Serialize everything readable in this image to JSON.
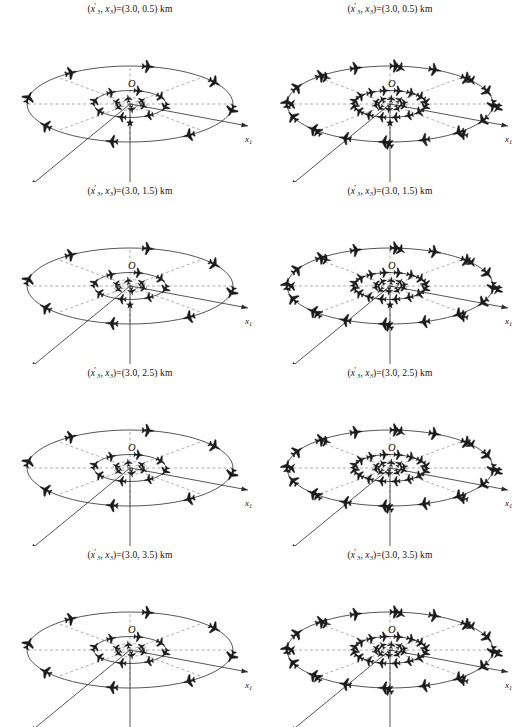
{
  "figure": {
    "type": "multi-panel-3d-geometry-diagram",
    "rows": 4,
    "columns": 2,
    "axes": {
      "x1_label": "x",
      "x1_sub": "1",
      "x2_label": "x",
      "x2_sub": "2",
      "x3_label": "x",
      "x3_sub": "3",
      "origin_label": "O"
    },
    "title_prefix": "(",
    "title_var1": "x",
    "title_var1_sub": "3",
    "title_prime": "′",
    "title_sep": ", ",
    "title_var2": "x",
    "title_var2_sub": "3",
    "title_eq": ")=(",
    "title_close": ") km",
    "colors": {
      "stroke": "#2b2b2b",
      "dashed": "#777777",
      "ink": "#111111",
      "background": "#ffffff"
    }
  },
  "panels": [
    {
      "id": "panel-r1c1",
      "row": 1,
      "column": 1,
      "density": "sparse",
      "title": {
        "x0_value": "3.0",
        "x3_value": "0.5",
        "unit": "km",
        "full_text": "(x′3, x3)=(3.0, 0.5) km"
      },
      "has_star_marker": true,
      "outer_ring_count": 8,
      "inner_ring_count": 8
    },
    {
      "id": "panel-r1c2",
      "row": 1,
      "column": 2,
      "density": "dense",
      "title": {
        "x0_value": "3.0",
        "x3_value": "0.5",
        "unit": "km",
        "full_text": "(x′3, x3)=(3.0, 0.5) km"
      },
      "has_star_marker": true,
      "outer_ring_count": 16,
      "inner_ring_count": 16
    },
    {
      "id": "panel-r2c1",
      "row": 2,
      "column": 1,
      "density": "sparse",
      "title": {
        "x0_value": "3.0",
        "x3_value": "1.5",
        "unit": "km",
        "full_text": "(x′3, x3)=(3.0, 1.5) km"
      },
      "has_star_marker": true,
      "outer_ring_count": 8,
      "inner_ring_count": 8
    },
    {
      "id": "panel-r2c2",
      "row": 2,
      "column": 2,
      "density": "dense",
      "title": {
        "x0_value": "3.0",
        "x3_value": "1.5",
        "unit": "km",
        "full_text": "(x′3, x3)=(3.0, 1.5) km"
      },
      "has_star_marker": true,
      "outer_ring_count": 16,
      "inner_ring_count": 16
    },
    {
      "id": "panel-r3c1",
      "row": 3,
      "column": 1,
      "density": "sparse",
      "title": {
        "x0_value": "3.0",
        "x3_value": "2.5",
        "unit": "km",
        "full_text": "(x′3, x3)=(3.0, 2.5) km"
      },
      "has_star_marker": false,
      "outer_ring_count": 8,
      "inner_ring_count": 8
    },
    {
      "id": "panel-r3c2",
      "row": 3,
      "column": 2,
      "density": "dense",
      "title": {
        "x0_value": "3.0",
        "x3_value": "2.5",
        "unit": "km",
        "full_text": "(x′3, x3)=(3.0, 2.5) km"
      },
      "has_star_marker": false,
      "outer_ring_count": 16,
      "inner_ring_count": 16
    },
    {
      "id": "panel-r4c1",
      "row": 4,
      "column": 1,
      "density": "sparse",
      "title": {
        "x0_value": "3.0",
        "x3_value": "3.5",
        "unit": "km",
        "full_text": "(x′3, x3)=(3.0, 3.5) km"
      },
      "has_star_marker": false,
      "outer_ring_count": 8,
      "inner_ring_count": 8
    },
    {
      "id": "panel-r4c2",
      "row": 4,
      "column": 2,
      "density": "dense",
      "title": {
        "x0_value": "3.0",
        "x3_value": "3.5",
        "unit": "km",
        "full_text": "(x′3, x3)=(3.0, 3.5) km"
      },
      "has_star_marker": false,
      "outer_ring_count": 16,
      "inner_ring_count": 16
    }
  ]
}
